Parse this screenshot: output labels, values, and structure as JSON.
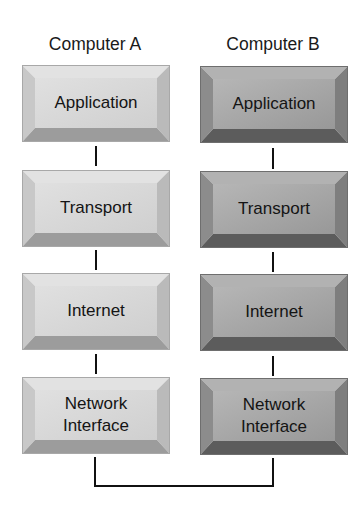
{
  "diagram": {
    "columns": [
      {
        "title": "Computer A",
        "style": "light",
        "colors": {
          "face": "#d6d6d6",
          "top": "#e4e4e4",
          "left": "#c6c6c6",
          "right": "#b8b8b8",
          "bottom": "#9a9a9a"
        },
        "layers": [
          {
            "label": "Application"
          },
          {
            "label": "Transport"
          },
          {
            "label": "Internet"
          },
          {
            "label": "Network\nInterface"
          }
        ]
      },
      {
        "title": "Computer B",
        "style": "dark",
        "colors": {
          "face": "#a4a4a4",
          "top": "#b4b4b4",
          "left": "#8e8e8e",
          "right": "#7c7c7c",
          "bottom": "#5a5a5a"
        },
        "layers": [
          {
            "label": "Application"
          },
          {
            "label": "Transport"
          },
          {
            "label": "Internet"
          },
          {
            "label": "Network\nInterface"
          }
        ]
      }
    ],
    "connection": "Network Interface A to Network Interface B"
  }
}
